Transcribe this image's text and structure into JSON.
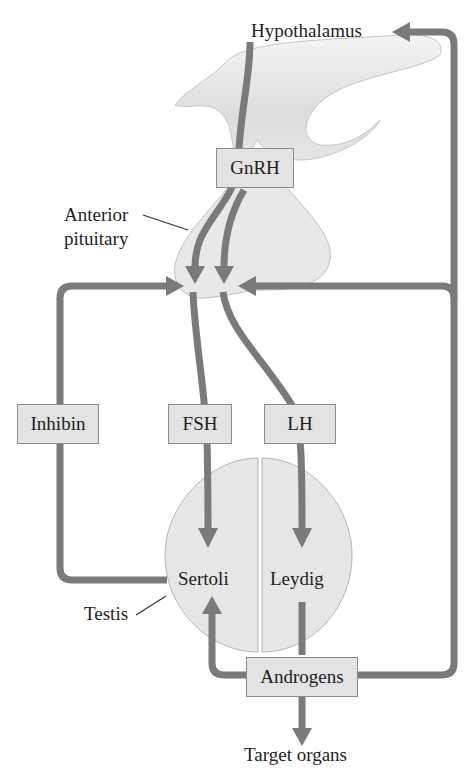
{
  "diagram": {
    "organs": {
      "hypothalamus": "Hypothalamus",
      "anterior_pituitary_line1": "Anterior",
      "anterior_pituitary_line2": "pituitary",
      "testis": "Testis",
      "sertoli": "Sertoli",
      "leydig": "Leydig",
      "target_organs": "Target organs"
    },
    "hormones": {
      "gnrh": "GnRH",
      "fsh": "FSH",
      "lh": "LH",
      "inhibin": "Inhibin",
      "androgens": "Androgens"
    },
    "colors": {
      "arrow": "#7a7a7a",
      "tissue_fill": "#e6e6e6",
      "tissue_stroke": "#b5b5b5",
      "box_fill": "#e3e3e3",
      "box_stroke": "#8c8c8c",
      "text": "#1e1e1e"
    },
    "pathways": [
      {
        "from": "Hypothalamus",
        "to": "Anterior pituitary",
        "via": "GnRH"
      },
      {
        "from": "Anterior pituitary",
        "to": "Sertoli",
        "via": "FSH"
      },
      {
        "from": "Anterior pituitary",
        "to": "Leydig",
        "via": "LH"
      },
      {
        "from": "Sertoli",
        "to": "Anterior pituitary",
        "via": "Inhibin"
      },
      {
        "from": "Leydig",
        "to": "Sertoli",
        "via": "Androgens"
      },
      {
        "from": "Leydig",
        "to": "Hypothalamus",
        "via": "Androgens"
      },
      {
        "from": "Leydig",
        "to": "Anterior pituitary",
        "via": "Androgens"
      },
      {
        "from": "Leydig",
        "to": "Target organs",
        "via": "Androgens"
      }
    ]
  }
}
